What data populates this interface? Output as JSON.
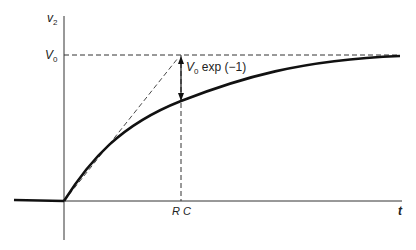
{
  "diagram": {
    "type": "RC charging curve",
    "y_axis_label": "v",
    "y_axis_sub": "2",
    "v0_label": "V",
    "v0_sub": "0",
    "annotation_V": "V",
    "annotation_sub": "0",
    "annotation_rest": " exp (−1)",
    "rc_label": "R C",
    "t_label": "t",
    "colors": {
      "line": "#111111",
      "dash": "#333333"
    }
  }
}
